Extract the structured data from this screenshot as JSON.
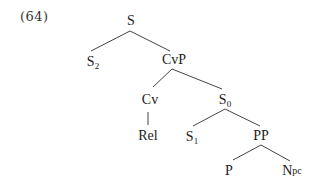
{
  "example": {
    "number": "(64)"
  },
  "tree": {
    "nodes": {
      "S": {
        "label": "S",
        "sub": ""
      },
      "S2": {
        "label": "S",
        "sub": "2"
      },
      "CvP": {
        "label": "CvP",
        "sub": ""
      },
      "Cv": {
        "label": "Cv",
        "sub": ""
      },
      "Rel": {
        "label": "Rel",
        "sub": ""
      },
      "S0": {
        "label": "S",
        "sub": "0"
      },
      "S1": {
        "label": "S",
        "sub": "1"
      },
      "PP": {
        "label": "PP",
        "sub": ""
      },
      "P": {
        "label": "P",
        "sub": ""
      },
      "Npc": {
        "label": "N",
        "suffix": "pc"
      }
    },
    "edges": [
      {
        "from": "S",
        "to": "S2"
      },
      {
        "from": "S",
        "to": "CvP"
      },
      {
        "from": "CvP",
        "to": "Cv"
      },
      {
        "from": "CvP",
        "to": "S0"
      },
      {
        "from": "Cv",
        "to": "Rel"
      },
      {
        "from": "S0",
        "to": "S1"
      },
      {
        "from": "S0",
        "to": "PP"
      },
      {
        "from": "PP",
        "to": "P"
      },
      {
        "from": "PP",
        "to": "Npc"
      }
    ],
    "line_color": "#444444"
  }
}
